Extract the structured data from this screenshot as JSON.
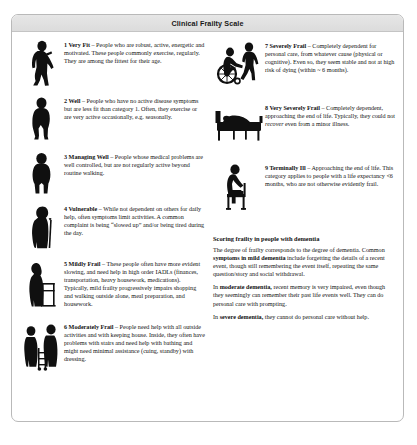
{
  "card": {
    "title": "Clinical Frailty Scale"
  },
  "left_column": [
    {
      "icon": "standing-fit-person-icon",
      "lead": "1 Very Fit",
      "dash": " – ",
      "text": "People who are robust, active, energetic and motivated. These people commonly exercise, regularly. They are among the fittest for their age."
    },
    {
      "icon": "walking-person-icon",
      "lead": "2 Well",
      "dash": " – ",
      "text": "People who have no active disease symptoms but are less fit than category 1. Often, they exercise or are very active occasionally, e.g. seasonally."
    },
    {
      "icon": "standing-person-icon",
      "lead": "3 Managing Well",
      "dash": " – ",
      "text": "People whose medical problems are well controlled, but are not regularly active beyond routine walking."
    },
    {
      "icon": "person-with-cane-icon",
      "lead": "4 Vulnerable",
      "dash": " – ",
      "text": "While not dependent on others for daily help, often symptoms limit activities. A common complaint is being “slowed up” and/or being tired during the day."
    },
    {
      "icon": "person-with-walker-icon",
      "lead": "5 Mildly Frail",
      "dash": " – ",
      "text": "These people often have more evident slowing, and need help in high order IADLs (finances, transportation, heavy housework, medications). Typically, mild frailty progressively impairs shopping and walking outside alone, meal preparation, and housework."
    },
    {
      "icon": "two-people-with-cart-icon",
      "lead": "6 Moderately Frail",
      "dash": " – ",
      "text": "People need help with all outside activities and with keeping house. Inside, they often have problems with stairs and need help with bathing and might need minimal assistance (cuing, standby) with dressing."
    }
  ],
  "right_column": [
    {
      "icon": "wheelchair-with-attendant-icon",
      "lead": "7 Severely Frail",
      "dash": " – ",
      "text": "Completely dependent for personal care, from whatever cause (physical or cognitive). Even so, they seem stable and not at high risk of dying (within ~ 6 months)."
    },
    {
      "icon": "person-in-bed-icon",
      "lead": "8 Very Severely Frail",
      "dash": " – ",
      "text_before_italic": "Completely dependent, approaching the end of life. Typically, they could not ",
      "text_italic": "recover",
      "text_after_italic": " even from a minor illness."
    },
    {
      "icon": "seated-person-icon",
      "lead": "9 Terminally Ill",
      "dash": " – ",
      "text": "Approaching the end of life. This category applies to people with a life expectancy <6 months, who are not otherwise evidently frail."
    }
  ],
  "dementia_section": {
    "heading_normal": "Scoring frailty in people with dementia",
    "paragraph1": {
      "part1": "The degree of frailty corresponds to the degree of dementia. Common ",
      "bold1": "symptoms in mild dementia",
      "part2": " include forgetting the details of a recent event, though still remembering the event itself, repeating the same question/story and social withdrawal."
    },
    "paragraph2": {
      "part1": "In ",
      "bold1": "moderate dementia,",
      "part2": " recent memory is very impaired, even though they seemingly can remember their past life events well. They can do personal care with prompting."
    },
    "paragraph3": {
      "part1": "In ",
      "bold1": "severe dementia,",
      "part2": " they cannot do personal care without help."
    }
  }
}
